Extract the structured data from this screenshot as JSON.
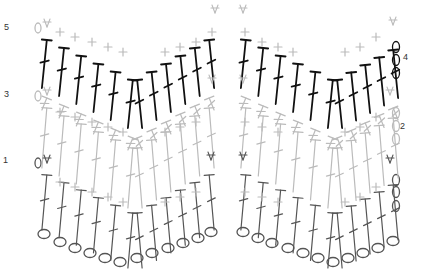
{
  "diagram": {
    "type": "crochet-stitch-chart",
    "pattern": "chevron / ripple",
    "colors": {
      "row1": "#555555",
      "row2": "#bbbbbb",
      "row3": "#bbbbbb",
      "row4": "#111111",
      "row5": "#bbbbbb",
      "chain": "#555555",
      "label": "#333333"
    },
    "row_labels": [
      {
        "text": "5",
        "x": 4,
        "y": 24
      },
      {
        "text": "3",
        "x": 4,
        "y": 92
      },
      {
        "text": "1",
        "x": 4,
        "y": 158
      },
      {
        "text": "4",
        "x": 403,
        "y": 55
      },
      {
        "text": "2",
        "x": 400,
        "y": 124
      }
    ],
    "stitch_legend": {
      "chain": "oval (ch)",
      "single_crochet": "cross (sc)",
      "double_crochet": "tall stem with bar (dc)",
      "dc2tog": "inverted V (dc2tog)"
    },
    "repeats": 2
  }
}
